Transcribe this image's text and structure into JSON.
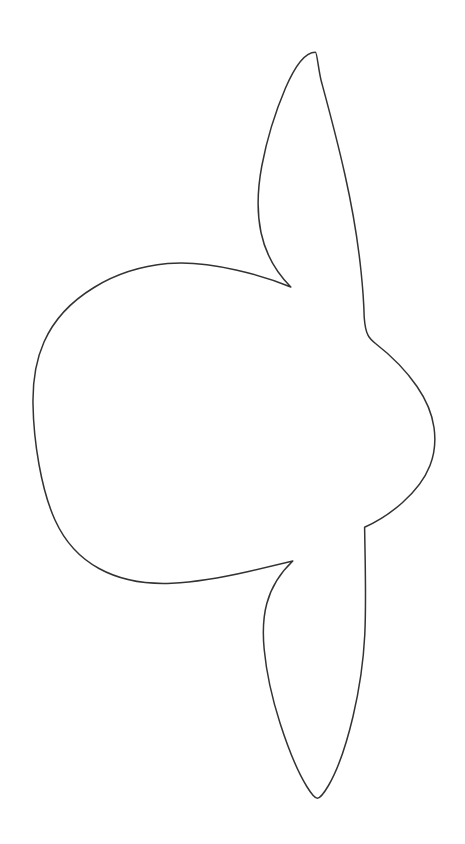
{
  "document": {
    "title": "Ocean Sunfish Outline",
    "subject": "ocean-sunfish-mola-mola",
    "style": "line-art-coloring-page",
    "background_color": "#ffffff",
    "stroke_color": "#333333",
    "fill_color": "#ffffff",
    "stroke_width": 1.5,
    "canvas": {
      "width": 465,
      "height": 844
    }
  },
  "figure": {
    "name": "sunfish-outline",
    "parts": [
      {
        "name": "body",
        "label": "Body"
      },
      {
        "name": "dorsal-fin",
        "label": "Dorsal fin"
      },
      {
        "name": "anal-fin",
        "label": "Anal fin"
      },
      {
        "name": "clavus",
        "label": "Clavus (rudder)"
      }
    ],
    "key_points": {
      "dorsal_fin_tip": [
        315,
        52
      ],
      "dorsal_fin_left_extreme": [
        259,
        186
      ],
      "dorsal_notch_left_cusp": [
        291,
        287
      ],
      "body_top_crest": [
        168,
        264
      ],
      "body_left_extreme": [
        33,
        450
      ],
      "body_bottom_trough": [
        172,
        583
      ],
      "anal_notch_left_cusp": [
        293,
        561
      ],
      "anal_fin_left_extreme": [
        264,
        648
      ],
      "anal_fin_tip": [
        317,
        798
      ],
      "clavus_top_corner": [
        364,
        317
      ],
      "clavus_right_extreme": [
        434,
        428
      ],
      "clavus_bottom_corner": [
        365,
        527
      ]
    },
    "outline_path": "M 315.5 52.2 C 305.0 52.0 295.0 66.0 285.5 88.0 C 275.5 111.5 266.5 141.0 261.8 166.0 C 257.2 190.5 256.8 212.5 261.0 232.5 C 265.0 251.5 273.5 269.5 290.8 287.0 C 275.0 280.5 256.0 274.5 236.0 270.0 C 211.0 264.3 186.5 261.8 167.5 263.6 C 140.0 266.2 116.0 274.0 94.0 287.5 C 71.0 301.5 53.5 320.5 44.0 342.0 C 35.5 361.2 32.6 381.5 33.0 404.0 C 33.3 424.0 35.4 444.5 39.0 464.5 C 42.6 484.5 47.5 503.5 55.0 520.0 C 64.5 541.0 79.0 557.5 99.0 568.5 C 119.0 579.5 142.5 584.5 171.8 583.2 C 198.0 582.0 224.5 577.0 248.5 571.5 C 265.5 567.6 280.0 564.0 292.8 561.0 C 279.0 574.0 271.0 588.0 266.8 603.5 C 262.6 619.0 262.8 635.0 264.2 649.5 C 266.4 672.5 272.0 698.0 280.0 723.0 C 288.5 749.5 298.5 773.0 306.8 786.5 C 311.5 794.2 314.8 798.2 317.4 798.2 C 320.0 798.2 323.5 794.0 328.5 785.5 C 337.5 770.0 346.5 744.0 353.0 716.5 C 359.5 689.0 363.5 660.5 364.8 634.5 C 365.6 617.0 365.6 588.0 365.2 561.0 C 365.0 546.5 364.8 535.0 364.6 527.2 C 376.5 522.0 390.0 513.5 402.0 503.0 C 414.5 492.0 424.5 479.5 430.0 465.5 C 435.0 452.5 435.8 440.0 434.0 427.5 C 432.0 413.5 426.0 399.5 417.0 386.5 C 406.0 370.5 391.0 355.5 375.5 343.5 C 369.5 338.8 365.5 335.5 364.2 317.2 C 364.0 309.0 363.2 292.0 361.0 271.0 C 358.0 242.0 352.5 208.5 345.0 175.0 C 337.0 139.0 328.0 106.0 321.5 82.0 C 318.5 70.5 317.0 52.3 315.5 52.2 Z"
  }
}
